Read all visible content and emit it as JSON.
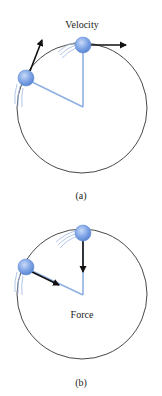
{
  "panel_a": {
    "label": "Velocity",
    "caption": "(a)"
  },
  "panel_b": {
    "label": "Force",
    "caption": "(b)"
  },
  "colors": {
    "ball": "#7aa3e6",
    "string": "#8fb0e3",
    "arrow": "#111111",
    "circle": "#333333",
    "motion_lines": "#9fb8e0"
  }
}
